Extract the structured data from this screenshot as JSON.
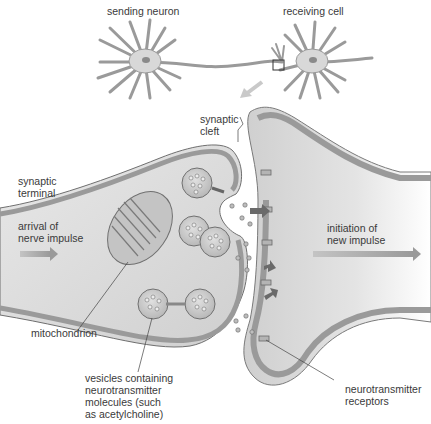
{
  "diagram": {
    "colors": {
      "membrane": "#8d8d8d",
      "membrane_dark": "#6a6a6a",
      "cytoplasm": "#dcdcdc",
      "background": "#ffffff",
      "arrow": "#a9a9a9",
      "text": "#3a3a3a"
    },
    "overview": {
      "sending_neuron": "sending neuron",
      "receiving_cell": "receiving cell"
    },
    "labels": {
      "synaptic_cleft": [
        "synaptic",
        "cleft"
      ],
      "synaptic_terminal": [
        "synaptic",
        "terminal"
      ],
      "arrival": [
        "arrival of",
        "nerve impulse"
      ],
      "initiation": [
        "initiation of",
        "new impulse"
      ],
      "mitochondrion": "mitochondrion",
      "vesicles": [
        "vesicles containing",
        "neurotransmitter",
        "molecules (such",
        "as acetylcholine)"
      ],
      "receptors": [
        "neurotransmitter",
        "receptors"
      ]
    }
  }
}
